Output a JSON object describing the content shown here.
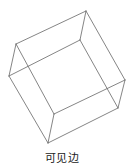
{
  "figure": {
    "type": "wireframe-cube",
    "stroke_color": "#666666",
    "stroke_width": 0.8,
    "vertices": {
      "A": [
        86,
        11
      ],
      "B": [
        16,
        44
      ],
      "C": [
        9,
        76
      ],
      "D": [
        80,
        40
      ],
      "E": [
        125,
        80
      ],
      "F": [
        118,
        108
      ],
      "G": [
        54,
        114
      ],
      "H": [
        48,
        143
      ]
    },
    "edges": [
      [
        "A",
        "B"
      ],
      [
        "A",
        "D"
      ],
      [
        "A",
        "E"
      ],
      [
        "B",
        "C"
      ],
      [
        "B",
        "G"
      ],
      [
        "C",
        "D"
      ],
      [
        "C",
        "H"
      ],
      [
        "D",
        "F"
      ],
      [
        "E",
        "F"
      ],
      [
        "E",
        "G"
      ],
      [
        "F",
        "H"
      ],
      [
        "G",
        "H"
      ]
    ]
  },
  "caption": {
    "text": "可见边"
  }
}
